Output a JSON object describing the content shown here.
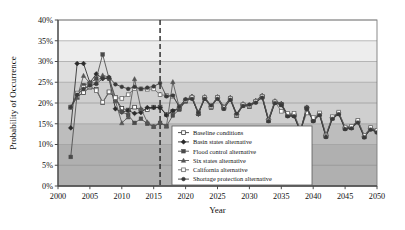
{
  "chart_data": {
    "type": "line",
    "title": "",
    "xlabel": "Year",
    "ylabel": "Probability of Occurrence",
    "xlim": [
      2000,
      2050
    ],
    "ylim": [
      0,
      40
    ],
    "xticks": [
      2000,
      2005,
      2010,
      2015,
      2020,
      2025,
      2030,
      2035,
      2040,
      2045,
      2050
    ],
    "xtick_labels": [
      "2000",
      "2005",
      "2010",
      "2015",
      "2020",
      "2025",
      "2030",
      "2035",
      "2040",
      "2045",
      "2050"
    ],
    "yticks": [
      0,
      5,
      10,
      15,
      20,
      25,
      30,
      35,
      40
    ],
    "ytick_labels": [
      "0%",
      "5%",
      "10%",
      "15%",
      "20%",
      "25%",
      "30%",
      "35%",
      "40%"
    ],
    "grid": "horizontal",
    "legend_position": "lower-center",
    "annotations": [
      {
        "name": "vertical-divider",
        "type": "vline",
        "x": 2016,
        "style": "dashed",
        "color": "#333333"
      }
    ],
    "background_bands": [
      {
        "from": 0,
        "to": 10,
        "color": "#b0b0b0"
      },
      {
        "from": 10,
        "to": 15,
        "color": "#bdbdbd"
      },
      {
        "from": 15,
        "to": 25,
        "color": "#cfcfcf"
      },
      {
        "from": 25,
        "to": 30,
        "color": "#dedede"
      },
      {
        "from": 30,
        "to": 35,
        "color": "#ededed"
      },
      {
        "from": 35,
        "to": 40,
        "color": "#ffffff"
      }
    ],
    "x": [
      2002,
      2003,
      2004,
      2005,
      2006,
      2007,
      2008,
      2009,
      2010,
      2011,
      2012,
      2013,
      2014,
      2015,
      2016,
      2017,
      2018,
      2019,
      2020,
      2021,
      2022,
      2023,
      2024,
      2025,
      2026,
      2027,
      2028,
      2029,
      2030,
      2031,
      2032,
      2033,
      2034,
      2035,
      2036,
      2037,
      2038,
      2039,
      2040,
      2041,
      2042,
      2043,
      2044,
      2045,
      2046,
      2047,
      2048,
      2049,
      2050
    ],
    "series": [
      {
        "name": "Baseline conditions",
        "marker": "open-square",
        "color": "#3f3f3f",
        "values": [
          19.0,
          21.5,
          22.5,
          23.8,
          23.3,
          20.1,
          22.6,
          21.2,
          18.7,
          18.3,
          19.0,
          18.3,
          18.4,
          19.0,
          19.0,
          17.2,
          18.0,
          18.6,
          20.5,
          21.3,
          17.5,
          21.2,
          19.0,
          21.3,
          18.8,
          21.0,
          17.0,
          19.5,
          19.2,
          20.3,
          21.5,
          15.8,
          20.2,
          19.7,
          17.0,
          17.0,
          13.2,
          18.8,
          15.8,
          17.3,
          12.0,
          16.4,
          17.5,
          13.9,
          14.1,
          15.5,
          11.9,
          13.8,
          13.1
        ]
      },
      {
        "name": "Basin states alternative",
        "marker": "filled-diamond",
        "color": "#2a2a2a",
        "values": [
          14.0,
          29.5,
          29.5,
          24.9,
          27.0,
          25.9,
          25.9,
          18.6,
          17.8,
          18.2,
          17.5,
          17.7,
          18.9,
          18.9,
          18.9,
          17.1,
          18.1,
          18.8,
          20.6,
          21.5,
          17.3,
          21.4,
          19.2,
          21.4,
          19.0,
          21.2,
          17.2,
          19.7,
          19.4,
          20.5,
          21.7,
          16.0,
          20.4,
          19.8,
          17.1,
          17.1,
          13.3,
          18.9,
          15.9,
          17.4,
          12.1,
          16.5,
          17.6,
          14.0,
          14.2,
          15.6,
          12.0,
          13.9,
          13.2
        ]
      },
      {
        "name": "Flood control alternative",
        "marker": "filled-square",
        "color": "#4a4a4a",
        "values": [
          7.0,
          22.2,
          24.3,
          24.8,
          25.9,
          31.7,
          25.9,
          21.4,
          17.9,
          17.1,
          15.2,
          16.2,
          15.0,
          14.3,
          15.2,
          14.4,
          17.0,
          18.4,
          20.4,
          21.2,
          17.4,
          21.1,
          18.9,
          21.2,
          18.7,
          20.9,
          16.9,
          19.4,
          19.1,
          20.2,
          21.4,
          15.7,
          20.1,
          19.6,
          16.9,
          16.9,
          13.1,
          18.7,
          15.7,
          17.2,
          11.9,
          16.3,
          17.4,
          13.8,
          14.0,
          15.4,
          11.8,
          13.7,
          13.0
        ]
      },
      {
        "name": "Six states alternative",
        "marker": "filled-triangle",
        "color": "#555555",
        "values": [
          19.0,
          21.3,
          26.6,
          24.7,
          24.9,
          26.7,
          26.2,
          20.5,
          15.2,
          16.6,
          25.8,
          18.6,
          15.4,
          14.3,
          15.3,
          14.4,
          25.1,
          19.0,
          20.8,
          21.6,
          17.6,
          21.5,
          19.3,
          21.5,
          19.1,
          21.3,
          17.3,
          19.8,
          19.5,
          20.6,
          21.8,
          16.1,
          20.5,
          19.9,
          17.2,
          17.2,
          13.4,
          19.0,
          16.0,
          17.5,
          12.2,
          16.6,
          17.7,
          14.1,
          14.3,
          15.7,
          12.1,
          14.0,
          13.3
        ]
      },
      {
        "name": "California alternative",
        "marker": "open-square",
        "color": "#6a6a6a",
        "values": [
          19.0,
          22.4,
          23.8,
          23.9,
          23.0,
          20.2,
          22.7,
          21.3,
          21.1,
          22.0,
          23.5,
          23.4,
          23.3,
          23.4,
          22.0,
          21.8,
          21.6,
          19.2,
          20.7,
          21.4,
          17.8,
          21.3,
          19.1,
          21.3,
          18.9,
          21.1,
          17.1,
          19.6,
          19.3,
          20.4,
          21.6,
          15.9,
          20.3,
          18.0,
          17.5,
          17.5,
          13.5,
          17.6,
          16.5,
          17.6,
          12.3,
          16.7,
          17.8,
          14.2,
          14.4,
          15.8,
          12.2,
          14.1,
          13.4
        ]
      },
      {
        "name": "Shortage protection alternative",
        "marker": "filled-circle",
        "color": "#3a3a3a",
        "values": [
          19.0,
          22.0,
          23.4,
          24.2,
          24.6,
          25.9,
          26.2,
          24.5,
          23.9,
          23.4,
          23.9,
          23.4,
          23.7,
          24.0,
          24.8,
          21.6,
          21.8,
          19.1,
          20.9,
          21.0,
          17.7,
          21.0,
          19.4,
          21.0,
          18.6,
          20.8,
          17.4,
          19.3,
          19.6,
          20.1,
          21.3,
          15.6,
          20.0,
          19.5,
          16.8,
          16.8,
          13.0,
          18.6,
          15.6,
          17.1,
          11.8,
          16.2,
          17.3,
          13.7,
          13.9,
          15.3,
          11.7,
          13.6,
          12.9
        ]
      }
    ]
  },
  "legend": {
    "items": [
      {
        "label": "Baseline conditions"
      },
      {
        "label": "Basin states alternative"
      },
      {
        "label": "Flood control alternative"
      },
      {
        "label": "Six states alternative"
      },
      {
        "label": "California alternative"
      },
      {
        "label": "Shortage protection alternative"
      }
    ]
  }
}
